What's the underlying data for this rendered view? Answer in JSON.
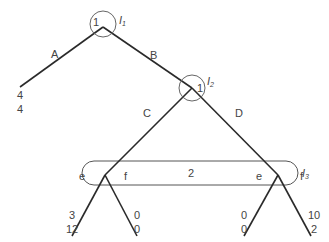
{
  "nodes": {
    "root": {
      "player": "1",
      "info_set": "I",
      "info_set_sub": "1"
    },
    "n2": {
      "player": "1",
      "info_set": "I",
      "info_set_sub": "2"
    },
    "info_set_3": {
      "player": "2",
      "info_set": "I",
      "info_set_sub": "3"
    }
  },
  "branches": {
    "A": "A",
    "B": "B",
    "C": "C",
    "D": "D",
    "left_e": "e",
    "left_f": "f",
    "right_e": "e",
    "right_f": "f"
  },
  "payoffs": {
    "A": {
      "p1": "4",
      "p2": "4"
    },
    "Ce": {
      "p1": "3",
      "p2": "12"
    },
    "Cf": {
      "p1": "0",
      "p2": "0"
    },
    "De": {
      "p1": "0",
      "p2": "0"
    },
    "Df": {
      "p1": "10",
      "p2": "2"
    }
  },
  "colors": {
    "line": "#2a2a2a",
    "circle": "#666666",
    "text": "#444444"
  }
}
